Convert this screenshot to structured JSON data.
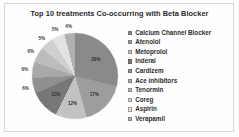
{
  "chart_data": {
    "type": "pie",
    "title": "Top 10 treatments Co-occurring with Beta Blocker",
    "xlabel": "",
    "ylabel": "",
    "legend_position": "right",
    "grid": false,
    "categories": [
      "Calcium Channel Blocker",
      "Atenolol",
      "Metoprolol",
      "Inderal",
      "Cardizem",
      "Ace inhibitors",
      "Tenormin",
      "Coreg",
      "Aspirin",
      "Verapamil"
    ],
    "values": [
      29,
      17,
      12,
      11,
      6,
      6,
      6,
      5,
      5,
      4
    ],
    "value_labels": [
      "29%",
      "17%",
      "12%",
      "11%",
      "6%",
      "6%",
      "6%",
      "5%",
      "5%",
      "4%"
    ],
    "colors": [
      "#8a8a8a",
      "#9d9d9d",
      "#c2c2c2",
      "#777777",
      "#8f8f8f",
      "#a8a8a8",
      "#bcbcbc",
      "#cfcfcf",
      "#e2e2e2",
      "#b0b0b0"
    ]
  },
  "legend": {
    "items": [
      {
        "label": "Calcium Channel Blocker",
        "color": "#8a8a8a"
      },
      {
        "label": "Atenolol",
        "color": "#9d9d9d"
      },
      {
        "label": "Metoprolol",
        "color": "#c2c2c2"
      },
      {
        "label": "Inderal",
        "color": "#777777"
      },
      {
        "label": "Cardizem",
        "color": "#8f8f8f"
      },
      {
        "label": "Ace inhibitors",
        "color": "#a8a8a8"
      },
      {
        "label": "Tenormin",
        "color": "#bcbcbc"
      },
      {
        "label": "Coreg",
        "color": "#cfcfcf"
      },
      {
        "label": "Aspirin",
        "color": "#e2e2e2"
      },
      {
        "label": "Verapamil",
        "color": "#b0b0b0"
      }
    ]
  }
}
